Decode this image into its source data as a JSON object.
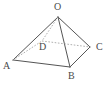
{
  "figure": {
    "name": "quadrilateral-pyramid",
    "background_color": "#ffffff",
    "stroke_color": "#555555",
    "hidden_stroke_color": "#9a9a9a",
    "label_color": "#4a4a4a",
    "canvas": {
      "width": 110,
      "height": 86
    },
    "vertices": [
      {
        "id": "O",
        "label": "O",
        "x": 58,
        "y": 17,
        "label_x": 54,
        "label_y": 2,
        "hidden": false
      },
      {
        "id": "A",
        "label": "A",
        "x": 13,
        "y": 60,
        "label_x": 3,
        "label_y": 61,
        "hidden": false
      },
      {
        "id": "B",
        "label": "B",
        "x": 70,
        "y": 67,
        "label_x": 68,
        "label_y": 71,
        "hidden": false
      },
      {
        "id": "C",
        "label": "C",
        "x": 90,
        "y": 47,
        "label_x": 96,
        "label_y": 42,
        "hidden": false
      },
      {
        "id": "D",
        "label": "D",
        "x": 42,
        "y": 41,
        "label_x": 39,
        "label_y": 42,
        "hidden": true
      }
    ],
    "edges": [
      {
        "id": "OA",
        "from": "O",
        "to": "A",
        "style": "solid"
      },
      {
        "id": "OB",
        "from": "O",
        "to": "B",
        "style": "solid"
      },
      {
        "id": "OC",
        "from": "O",
        "to": "C",
        "style": "solid"
      },
      {
        "id": "OD",
        "from": "O",
        "to": "D",
        "style": "dashed"
      },
      {
        "id": "AB",
        "from": "A",
        "to": "B",
        "style": "solid"
      },
      {
        "id": "BC",
        "from": "B",
        "to": "C",
        "style": "solid"
      },
      {
        "id": "AD",
        "from": "A",
        "to": "D",
        "style": "dashed"
      },
      {
        "id": "DC",
        "from": "D",
        "to": "C",
        "style": "dashed"
      }
    ]
  }
}
